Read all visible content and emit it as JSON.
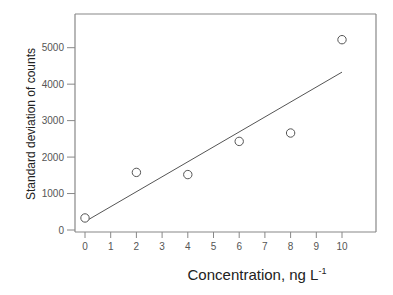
{
  "chart_data": {
    "type": "scatter",
    "title": "",
    "xlabel": "Concentration, ng L",
    "xlabel_superscript": "-1",
    "ylabel": "Standard deviation of counts",
    "xlim": [
      -0.4,
      11.3
    ],
    "ylim": [
      -100,
      5800
    ],
    "x_ticks": [
      0,
      1,
      2,
      3,
      4,
      5,
      6,
      7,
      8,
      9,
      10
    ],
    "y_ticks": [
      0,
      1000,
      2000,
      3000,
      4000,
      5000
    ],
    "grid": false,
    "legend": null,
    "series": [
      {
        "name": "measured",
        "kind": "scatter",
        "marker": "open-circle",
        "x": [
          0,
          2,
          4,
          6,
          8,
          10
        ],
        "y": [
          330,
          1580,
          1520,
          2430,
          2660,
          5220
        ]
      },
      {
        "name": "linear fit",
        "kind": "line",
        "x": [
          0,
          10
        ],
        "y": [
          230,
          4330
        ]
      }
    ],
    "colors": {
      "axis": "#888888",
      "marker": "#555555",
      "line": "#555555"
    }
  }
}
